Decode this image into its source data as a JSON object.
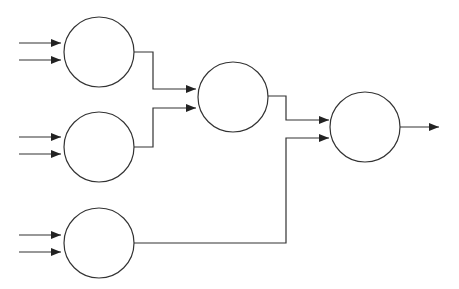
{
  "diagram": {
    "type": "neural-network-tree",
    "nodes": [
      {
        "id": "n1",
        "label": "",
        "cx": 99,
        "cy": 52,
        "r": 35
      },
      {
        "id": "n2",
        "label": "",
        "cx": 99,
        "cy": 147,
        "r": 35
      },
      {
        "id": "n3",
        "label": "",
        "cx": 99,
        "cy": 243,
        "r": 35
      },
      {
        "id": "n4",
        "label": "",
        "cx": 233,
        "cy": 97,
        "r": 35
      },
      {
        "id": "n5",
        "label": "",
        "cx": 365,
        "cy": 127,
        "r": 35
      }
    ],
    "inputs_per_leaf": 2,
    "edges": [
      {
        "from": "n1",
        "to": "n4"
      },
      {
        "from": "n2",
        "to": "n4"
      },
      {
        "from": "n4",
        "to": "n5"
      },
      {
        "from": "n3",
        "to": "n5"
      },
      {
        "from": "n5",
        "to": "output"
      }
    ],
    "stroke_color": "#222222"
  }
}
